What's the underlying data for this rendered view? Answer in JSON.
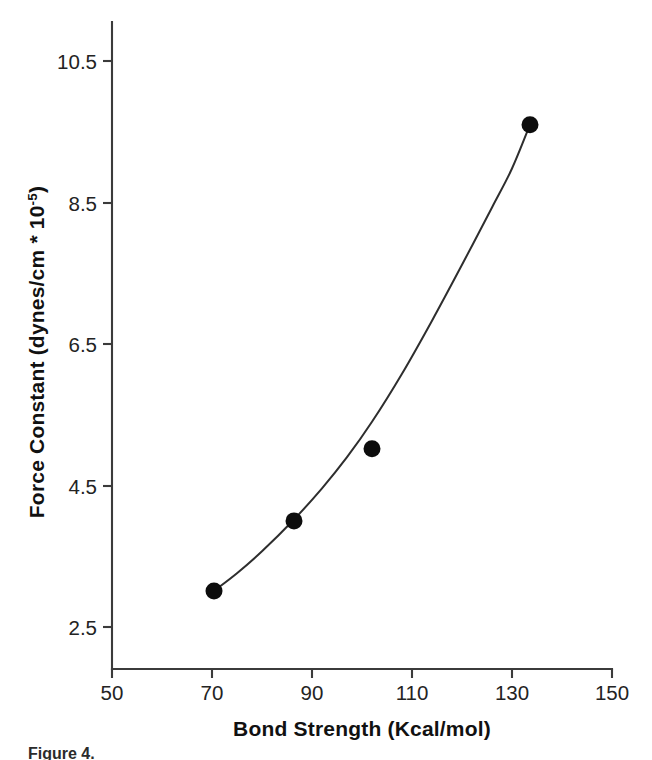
{
  "figure": {
    "background_color": "#ffffff",
    "ink_color": "#1a1a1a",
    "caption_partial": "Figure 4."
  },
  "chart_data": {
    "type": "scatter",
    "title": "",
    "subtitle": "",
    "xlabel_main": "Bond Strength (Kcal/mol)",
    "ylabel_main": "Force Constant (dynes/cm * 10",
    "ylabel_exponent": "-5",
    "ylabel_close": ")",
    "xlabel": "Bond Strength (Kcal/mol)",
    "ylabel": "Force Constant (dynes/cm * 10^-5)",
    "xlim": [
      50,
      150
    ],
    "ylim": [
      2.02,
      11.05
    ],
    "xticks": [
      50,
      70,
      90,
      110,
      130,
      150
    ],
    "xtick_labels": [
      "50",
      "70",
      "90",
      "110",
      "130",
      "150"
    ],
    "yticks": [
      2.5,
      4.5,
      6.5,
      8.5,
      10.5
    ],
    "ytick_labels": [
      "2.5",
      "4.5",
      "6.5",
      "8.5",
      "10.5"
    ],
    "grid": false,
    "legend": "none",
    "marker_style": "filled-circle",
    "marker_color": "#0d0d0d",
    "curve_color": "#2e2e2e",
    "points": [
      {
        "x": 70.4,
        "y": 3.01
      },
      {
        "x": 86.4,
        "y": 4.0
      },
      {
        "x": 102.0,
        "y": 5.02
      },
      {
        "x": 133.6,
        "y": 9.6
      }
    ],
    "fit_curve_points": [
      {
        "x": 70.4,
        "y": 3.01
      },
      {
        "x": 75.0,
        "y": 3.26
      },
      {
        "x": 80.0,
        "y": 3.57
      },
      {
        "x": 86.4,
        "y": 4.02
      },
      {
        "x": 92.0,
        "y": 4.46
      },
      {
        "x": 97.0,
        "y": 4.9
      },
      {
        "x": 102.0,
        "y": 5.4
      },
      {
        "x": 108.0,
        "y": 6.08
      },
      {
        "x": 114.0,
        "y": 6.83
      },
      {
        "x": 120.0,
        "y": 7.62
      },
      {
        "x": 126.0,
        "y": 8.43
      },
      {
        "x": 130.0,
        "y": 8.98
      },
      {
        "x": 133.6,
        "y": 9.6
      }
    ]
  },
  "axes": {
    "x_axis_name": "bond-strength-axis",
    "y_axis_name": "force-constant-axis"
  }
}
